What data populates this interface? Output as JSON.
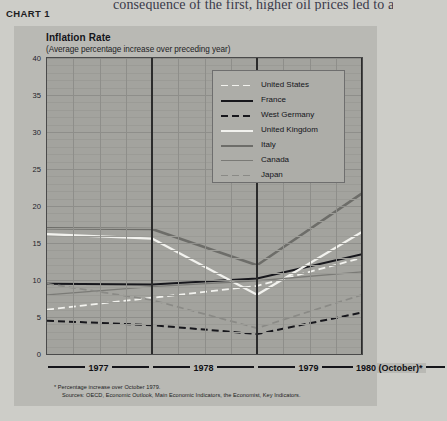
{
  "page": {
    "cutoff_text": "consequence of the first, higher oil prices led to a",
    "chart_label": "CHART 1"
  },
  "chart": {
    "title": "Inflation Rate",
    "subtitle": "(Average percentage increase over preceding year)"
  },
  "legend": {
    "items": [
      {
        "label": "United States",
        "style": "dashed",
        "color": "#f2f2ee",
        "width": 1.8
      },
      {
        "label": "France",
        "style": "solid",
        "color": "#17171c",
        "width": 2.0
      },
      {
        "label": "West Germany",
        "style": "dashed",
        "color": "#17171c",
        "width": 2.0
      },
      {
        "label": "United Kingdom",
        "style": "solid",
        "color": "#f2f2ee",
        "width": 2.0
      },
      {
        "label": "Italy",
        "style": "solid",
        "color": "#6d6d69",
        "width": 2.4
      },
      {
        "label": "Canada",
        "style": "solid",
        "color": "#7a7a76",
        "width": 1.2
      },
      {
        "label": "Japan",
        "style": "dashed",
        "color": "#8a8a86",
        "width": 1.6
      }
    ]
  },
  "xaxis": {
    "years": [
      "1977",
      "1978",
      "1979",
      "1980 (October)*"
    ]
  },
  "footnotes": [
    "* Percentage increase over  October 1979.",
    "Sources:  OECD, Economic Outlook, Main Economic Indicators, the Economist, Key Indicators."
  ],
  "chart_data": {
    "type": "line",
    "title": "Inflation Rate",
    "subtitle": "(Average percentage increase over preceding year)",
    "xlabel": "",
    "ylabel": "",
    "ylim": [
      0,
      40
    ],
    "yticks": [
      0,
      5,
      10,
      15,
      20,
      25,
      30,
      35,
      40
    ],
    "grid": true,
    "legend_position": "upper-right",
    "x": [
      "1977",
      "1978",
      "1979",
      "1980 (October)"
    ],
    "series": [
      {
        "name": "United States",
        "values": [
          6.0,
          7.6,
          9.2,
          13.0
        ],
        "color": "#f2f2ee",
        "style": "dashed",
        "width": 1.8
      },
      {
        "name": "France",
        "values": [
          9.5,
          9.4,
          10.2,
          13.5
        ],
        "color": "#17171c",
        "style": "solid",
        "width": 2.0
      },
      {
        "name": "West Germany",
        "values": [
          4.5,
          3.9,
          2.7,
          5.6
        ],
        "color": "#17171c",
        "style": "dashed",
        "width": 2.0
      },
      {
        "name": "United Kingdom",
        "values": [
          16.2,
          15.6,
          8.0,
          16.5
        ],
        "color": "#f2f2ee",
        "style": "solid",
        "width": 2.2
      },
      {
        "name": "Italy",
        "values": [
          17.0,
          16.9,
          12.0,
          21.7
        ],
        "color": "#6d6d69",
        "style": "solid",
        "width": 2.6
      },
      {
        "name": "Canada",
        "values": [
          8.0,
          9.1,
          9.9,
          11.1
        ],
        "color": "#7a7a76",
        "style": "solid",
        "width": 1.3
      },
      {
        "name": "Japan",
        "values": [
          9.5,
          7.3,
          3.5,
          8.0
        ],
        "color": "#8a8a86",
        "style": "dashed",
        "width": 1.7
      }
    ]
  }
}
